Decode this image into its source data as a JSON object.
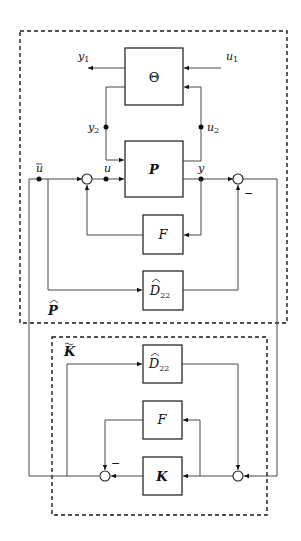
{
  "figure": {
    "type": "block-diagram",
    "outer_system": {
      "label": "P",
      "label_accent": "^",
      "blocks": [
        {
          "id": "theta",
          "label": "Θ"
        },
        {
          "id": "plant",
          "label": "P"
        },
        {
          "id": "feedback_f",
          "label": "F"
        },
        {
          "id": "d22_hat",
          "label": "D",
          "subscript": "22",
          "accent": "^"
        }
      ],
      "signals": {
        "y1": {
          "main": "y",
          "sub": "1"
        },
        "u1": {
          "main": "u",
          "sub": "1"
        },
        "y2": {
          "main": "y",
          "sub": "2"
        },
        "u2": {
          "main": "u",
          "sub": "2"
        },
        "u_bar": {
          "main": "u",
          "accent": "‾"
        },
        "u": {
          "main": "u"
        },
        "y": {
          "main": "y"
        }
      },
      "minus_sign": "−"
    },
    "controller_system": {
      "label": "K",
      "label_accent": "~",
      "blocks": [
        {
          "id": "d22_hat_k",
          "label": "D",
          "subscript": "22",
          "accent": "^"
        },
        {
          "id": "feedback_f_k",
          "label": "F"
        },
        {
          "id": "controller",
          "label": "K"
        }
      ],
      "minus_sign": "−"
    },
    "colors": {
      "line": "#333333",
      "block_border": "#1a1a1a",
      "background": "#ffffff"
    }
  }
}
